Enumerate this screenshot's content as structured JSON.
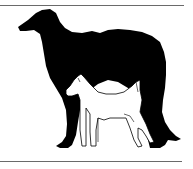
{
  "illustration": {
    "description": "Silhouette of a large long-haired sighthound with a smaller terrier outline standing in front",
    "figures": [
      {
        "name": "borzoi-silhouette",
        "fill": "#000000"
      },
      {
        "name": "terrier-outline",
        "fill": "#ffffff",
        "stroke": "#000000"
      }
    ],
    "rules": {
      "color": "#6a6a6a"
    }
  }
}
